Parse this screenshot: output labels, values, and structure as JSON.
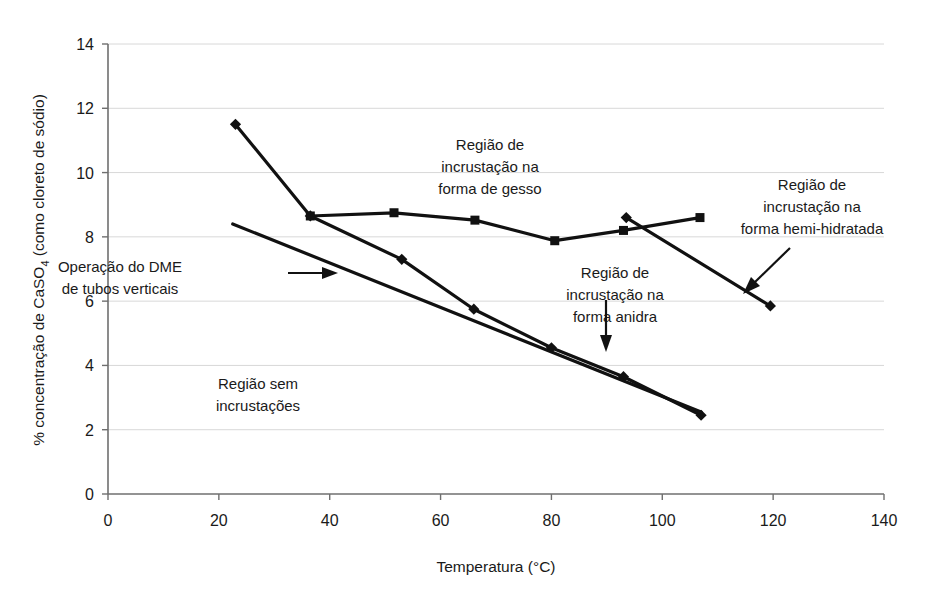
{
  "chart_data": {
    "type": "line",
    "title": "",
    "xlabel": "Temperatura (°C)",
    "ylabel": "% concentração de CaSO4 (como cloreto de sódio)",
    "ylabel_parts": {
      "prefix": "% concentração de CaSO",
      "sub": "4",
      "suffix": " (como cloreto de sódio)"
    },
    "xlim": [
      0,
      140
    ],
    "ylim": [
      0,
      14
    ],
    "xticks": [
      0,
      20,
      40,
      60,
      80,
      100,
      120,
      140
    ],
    "yticks": [
      0,
      2,
      4,
      6,
      8,
      10,
      12,
      14
    ],
    "grid": "horizontal",
    "legend": "none",
    "series": [
      {
        "name": "Limite gesso / anidra (diamantes)",
        "marker": "diamond",
        "points": [
          {
            "x": 23.0,
            "y": 11.5
          },
          {
            "x": 36.5,
            "y": 8.65
          },
          {
            "x": 53.0,
            "y": 7.3
          },
          {
            "x": 66.0,
            "y": 5.75
          },
          {
            "x": 80.0,
            "y": 4.55
          },
          {
            "x": 93.0,
            "y": 3.65
          },
          {
            "x": 107.0,
            "y": 2.45
          }
        ]
      },
      {
        "name": "Limite região de gesso (quadrados)",
        "marker": "square",
        "points": [
          {
            "x": 36.5,
            "y": 8.65
          },
          {
            "x": 51.6,
            "y": 8.75
          },
          {
            "x": 66.2,
            "y": 8.52
          },
          {
            "x": 80.6,
            "y": 7.88
          },
          {
            "x": 93.0,
            "y": 8.2
          },
          {
            "x": 106.8,
            "y": 8.6
          }
        ]
      },
      {
        "name": "Limite hemi-hidratada (diamantes)",
        "marker": "diamond",
        "points": [
          {
            "x": 93.5,
            "y": 8.6
          },
          {
            "x": 119.5,
            "y": 5.85
          }
        ]
      },
      {
        "name": "Operação do DME de tubos verticais",
        "marker": "none",
        "points": [
          {
            "x": 22.5,
            "y": 8.4
          },
          {
            "x": 107.0,
            "y": 2.55
          }
        ]
      }
    ],
    "annotations": [
      {
        "id": "gesso",
        "lines": [
          "Região de",
          "incrustação na",
          "forma de gesso"
        ],
        "x": 490,
        "y": 150
      },
      {
        "id": "hemi",
        "lines": [
          "Região de",
          "incrustação na",
          "forma hemi-hidratada"
        ],
        "x": 812,
        "y": 190
      },
      {
        "id": "anidra",
        "lines": [
          "Região de",
          "incrustação na",
          "forma anidra"
        ],
        "x": 615,
        "y": 278
      },
      {
        "id": "dme",
        "lines": [
          "Operação do DME",
          "de tubos verticais"
        ],
        "x": 120,
        "y": 272
      },
      {
        "id": "sem",
        "lines": [
          "Região sem",
          "incrustações"
        ],
        "x": 258,
        "y": 389
      }
    ]
  }
}
